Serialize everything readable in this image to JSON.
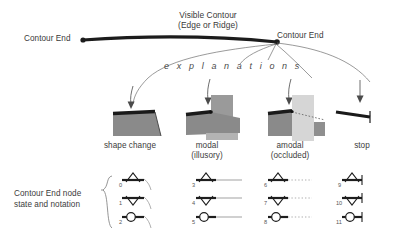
{
  "figure": {
    "top": {
      "visible_contour_line1": "Visible Contour",
      "visible_contour_line2": "(Edge or Ridge)",
      "contour_end_left": "Contour End",
      "contour_end_right": "Contour End",
      "explanations": "e x p l a n a t i o n s"
    },
    "cases": [
      {
        "id": "shape-change",
        "label_line1": "shape change",
        "label_line2": ""
      },
      {
        "id": "modal",
        "label_line1": "modal",
        "label_line2": "(illusory)"
      },
      {
        "id": "amodal",
        "label_line1": "amodal",
        "label_line2": "(occluded)"
      },
      {
        "id": "stop",
        "label_line1": "stop",
        "label_line2": ""
      }
    ],
    "legend": {
      "line1": "Contour End node",
      "line2": "state and notation"
    },
    "notation": {
      "columns": [
        {
          "case": "shape change",
          "tail": "none",
          "numbers": [
            "0",
            "1",
            "2"
          ]
        },
        {
          "case": "modal",
          "tail": "solid",
          "numbers": [
            "3",
            "4",
            "5"
          ]
        },
        {
          "case": "amodal",
          "tail": "dotted",
          "numbers": [
            "6",
            "7",
            "8"
          ]
        },
        {
          "case": "stop",
          "tail": "bar",
          "numbers": [
            "9",
            "10",
            "11"
          ]
        }
      ],
      "rows": [
        "peak",
        "valley",
        "circle"
      ]
    },
    "colors": {
      "ink": "#3a3a3a",
      "contour_thick": "#1a1a1a",
      "dark_gray_shape": "#7b7b7b",
      "mid_gray_shape": "#8f8f8f",
      "light_gray_shape": "#cfcfcf",
      "pale_gray_shape": "#d9d9d9",
      "tail_solid": "#b9b9b9",
      "background": "#ffffff"
    }
  }
}
